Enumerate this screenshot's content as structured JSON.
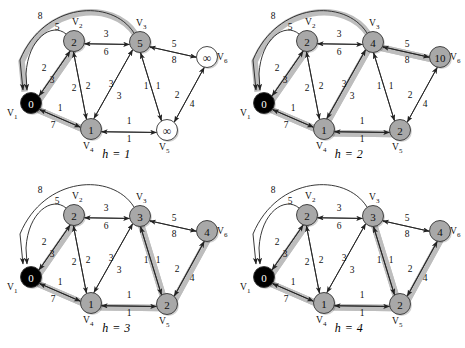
{
  "figure": {
    "background": "#ffffff",
    "panel_count": 4
  },
  "style": {
    "node_fill_gray": "#a8a8a8",
    "node_fill_white": "#ffffff",
    "node_fill_source": "#000000",
    "node_stroke": "#333333",
    "node_text_dark": "#111111",
    "node_text_light": "#ffffff",
    "edge_color": "#222222",
    "highlight_color": "#bdbdbd"
  },
  "vertex_labels": {
    "v1": "V",
    "v1sub": "1",
    "v2": "V",
    "v2sub": "2",
    "v3": "V",
    "v3sub": "3",
    "v4": "V",
    "v4sub": "4",
    "v5": "V",
    "v5sub": "5",
    "v6": "V",
    "v6sub": "6",
    "infinity": "∞"
  },
  "edge_weights": {
    "v1_v3_arc": "8",
    "v1_v2_arc": "5",
    "v1_v2_a": "2",
    "v1_v2_b": "3",
    "v2_v3_top": "3",
    "v2_v3_bot": "6",
    "v2_v4_a": "2",
    "v2_v4_b": "2",
    "v3_v4_a": "3",
    "v3_v4_b": "3",
    "v3_v5_a": "1",
    "v3_v5_b": "1",
    "v3_v6_top": "5",
    "v3_v6_bot": "8",
    "v5_v6_a": "2",
    "v5_v6_b": "4",
    "v1_v4_a": "1",
    "v1_v4_b": "7",
    "v4_v5_a": "1",
    "v4_v5_b": "1"
  },
  "panels": [
    {
      "id": "panel-h1",
      "caption": "h = 1",
      "nodes": {
        "v1": {
          "value": "0",
          "fill": "source"
        },
        "v2": {
          "value": "2",
          "fill": "gray"
        },
        "v3": {
          "value": "5",
          "fill": "gray"
        },
        "v4": {
          "value": "1",
          "fill": "gray"
        },
        "v5": {
          "value": "∞",
          "fill": "white"
        },
        "v6": {
          "value": "∞",
          "fill": "white"
        }
      },
      "highlighted_edges": [
        "v1_v3_arc",
        "v1_v2",
        "v1_v4"
      ]
    },
    {
      "id": "panel-h2",
      "caption": "h = 2",
      "nodes": {
        "v1": {
          "value": "0",
          "fill": "source"
        },
        "v2": {
          "value": "2",
          "fill": "gray"
        },
        "v3": {
          "value": "4",
          "fill": "gray"
        },
        "v4": {
          "value": "1",
          "fill": "gray"
        },
        "v5": {
          "value": "2",
          "fill": "gray"
        },
        "v6": {
          "value": "10",
          "fill": "gray"
        }
      },
      "highlighted_edges": [
        "v1_v3_arc",
        "v1_v2",
        "v1_v4",
        "v4_v5",
        "v3_v6",
        "v3_v4"
      ]
    },
    {
      "id": "panel-h3",
      "caption": "h = 3",
      "nodes": {
        "v1": {
          "value": "0",
          "fill": "source"
        },
        "v2": {
          "value": "2",
          "fill": "gray"
        },
        "v3": {
          "value": "3",
          "fill": "gray"
        },
        "v4": {
          "value": "1",
          "fill": "gray"
        },
        "v5": {
          "value": "2",
          "fill": "gray"
        },
        "v6": {
          "value": "4",
          "fill": "gray"
        }
      },
      "highlighted_edges": [
        "v1_v2",
        "v1_v4",
        "v4_v5",
        "v5_v6",
        "v3_v5"
      ]
    },
    {
      "id": "panel-h4",
      "caption": "h = 4",
      "nodes": {
        "v1": {
          "value": "0",
          "fill": "source"
        },
        "v2": {
          "value": "2",
          "fill": "gray"
        },
        "v3": {
          "value": "3",
          "fill": "gray"
        },
        "v4": {
          "value": "1",
          "fill": "gray"
        },
        "v5": {
          "value": "2",
          "fill": "gray"
        },
        "v6": {
          "value": "4",
          "fill": "gray"
        }
      },
      "highlighted_edges": [
        "v1_v2",
        "v1_v4",
        "v4_v5",
        "v5_v6",
        "v3_v5"
      ]
    }
  ]
}
